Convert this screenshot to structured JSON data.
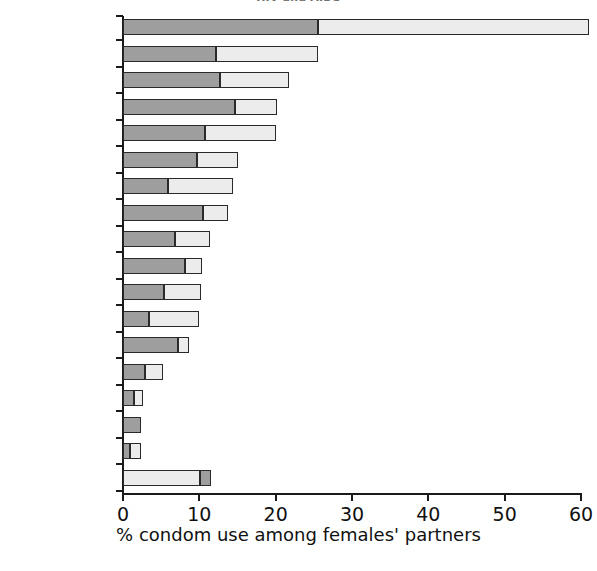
{
  "chart_data": {
    "type": "bar",
    "orientation": "horizontal",
    "stacked": true,
    "title": "HIV and AIDS",
    "xlabel": "% condom use among females' partners",
    "ylabel": "",
    "xlim": [
      0,
      60
    ],
    "xticks": [
      0,
      10,
      20,
      30,
      40,
      50,
      60
    ],
    "xticklabels": [
      "0",
      "10",
      "20",
      "30",
      "40",
      "50",
      "60"
    ],
    "grid": false,
    "legend": "none",
    "categories": [
      "South Africa",
      "Cameroon",
      "Ghana",
      "Zambia",
      "Burkina Faso",
      "Uganda",
      "Mozambique",
      "Tanzania",
      "Benin",
      "Kenya",
      "Guinea",
      "Mali",
      "Nigeria",
      "Rwanda",
      "Eritrea",
      "Madagascar",
      "Ethiopia",
      "Zimbabwe"
    ],
    "series": [
      {
        "name": "dark segment",
        "color": "#9e9e9e",
        "values": [
          25.6,
          12.2,
          12.7,
          14.7,
          10.8,
          9.7,
          5.9,
          10.5,
          6.8,
          8.1,
          5.4,
          3.4,
          7.2,
          2.9,
          1.4,
          2.4,
          0.9,
          1.4
        ]
      },
      {
        "name": "light segment",
        "color": "#ececec",
        "values": [
          35.4,
          13.4,
          9.1,
          5.5,
          9.2,
          5.4,
          8.5,
          3.3,
          4.6,
          2.3,
          4.8,
          6.6,
          1.5,
          2.3,
          1.2,
          0.0,
          1.4,
          10.1
        ]
      }
    ],
    "totals": [
      61.0,
      25.6,
      21.8,
      20.2,
      20.0,
      15.1,
      14.4,
      13.8,
      11.4,
      10.4,
      10.2,
      10.0,
      8.7,
      5.2,
      2.6,
      2.4,
      2.3,
      11.5
    ],
    "segment_order": [
      "dark-then-light",
      "dark-then-light",
      "dark-then-light",
      "dark-then-light",
      "dark-then-light",
      "dark-then-light",
      "dark-then-light",
      "dark-then-light",
      "dark-then-light",
      "dark-then-light",
      "dark-then-light",
      "dark-then-light",
      "dark-then-light",
      "dark-then-light",
      "dark-then-light",
      "dark-then-light",
      "dark-then-light",
      "light-then-dark"
    ]
  },
  "colors": {
    "dark": "#9e9e9e",
    "light": "#ececec",
    "outline": "#2a2a2a",
    "axis": "#1a1a1a",
    "text": "#111111",
    "background": "#ffffff"
  }
}
